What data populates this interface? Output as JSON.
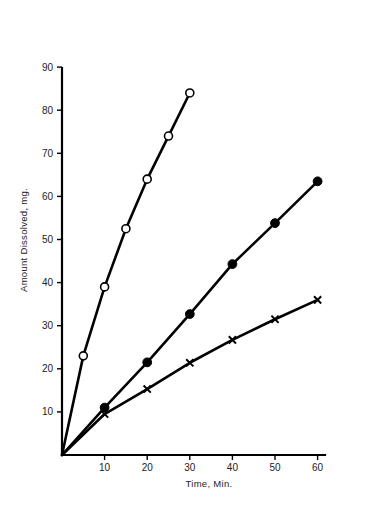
{
  "chart_data": {
    "type": "line",
    "title": "",
    "subtitle": "",
    "xlabel": "Time, Min.",
    "ylabel": "Amount Dissolved, mg.",
    "xlim": [
      0,
      62
    ],
    "ylim": [
      0,
      90
    ],
    "xticks": [
      10,
      20,
      30,
      40,
      50,
      60
    ],
    "yticks": [
      10,
      20,
      30,
      40,
      50,
      60,
      70,
      80,
      90
    ],
    "grid": false,
    "legend": "none",
    "series": [
      {
        "name": "open-circle-series",
        "marker": "open-circle",
        "x": [
          0,
          5,
          10,
          15,
          20,
          25,
          30
        ],
        "values": [
          0,
          23,
          39,
          52.5,
          64,
          74,
          84
        ]
      },
      {
        "name": "filled-circle-series",
        "marker": "filled-circle",
        "x": [
          0,
          10,
          20,
          30,
          40,
          50,
          60
        ],
        "values": [
          0,
          11,
          21.5,
          32.7,
          44.3,
          53.8,
          63.5
        ]
      },
      {
        "name": "cross-series",
        "marker": "cross",
        "x": [
          0,
          10,
          20,
          30,
          40,
          50,
          60
        ],
        "values": [
          0,
          9.5,
          15.3,
          21.4,
          26.7,
          31.5,
          36
        ]
      }
    ]
  },
  "axes": {
    "x_tick_labels": [
      "10",
      "20",
      "30",
      "40",
      "50",
      "60"
    ],
    "y_tick_labels": [
      "10",
      "20",
      "30",
      "40",
      "50",
      "60",
      "70",
      "80",
      "90"
    ],
    "x_axis_title": "Time, Min.",
    "y_axis_title": "Amount Dissolved, mg."
  }
}
